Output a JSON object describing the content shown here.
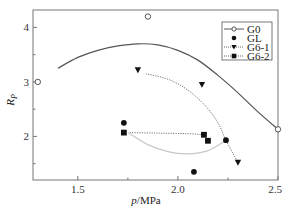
{
  "chart_data": {
    "type": "scatter",
    "title": "",
    "xlabel": "p/MPa",
    "ylabel": "R_P",
    "xlim": [
      1.276,
      2.5
    ],
    "ylim": [
      1.2,
      4.32
    ],
    "xticks": [
      1.5,
      2.0,
      2.5
    ],
    "xtick_labels": [
      "1.5",
      "2.0",
      "2.5"
    ],
    "xminor_ticks": [
      1.75,
      2.25
    ],
    "yticks": [
      2,
      3,
      4
    ],
    "ytick_labels": [
      "2",
      "3",
      "4"
    ],
    "yminor_ticks": [
      1.5,
      2.5,
      3.5
    ],
    "grid": false,
    "legend_position": "upper right",
    "series": [
      {
        "name": "G0",
        "marker": "open-circle",
        "line": "solid",
        "color": "#444444",
        "points": [
          [
            1.3,
            3.0
          ],
          [
            1.85,
            4.2
          ],
          [
            2.5,
            2.13
          ]
        ],
        "fit_curve": [
          [
            1.4,
            3.25
          ],
          [
            1.5,
            3.45
          ],
          [
            1.6,
            3.58
          ],
          [
            1.7,
            3.66
          ],
          [
            1.8,
            3.7
          ],
          [
            1.9,
            3.68
          ],
          [
            2.0,
            3.58
          ],
          [
            2.1,
            3.4
          ],
          [
            2.2,
            3.12
          ],
          [
            2.3,
            2.8
          ],
          [
            2.4,
            2.45
          ],
          [
            2.5,
            2.13
          ]
        ]
      },
      {
        "name": "GL",
        "marker": "filled-circle",
        "line": "solid-light",
        "color": "#bbbbbb",
        "points": [
          [
            1.73,
            2.25
          ],
          [
            2.08,
            1.35
          ],
          [
            2.24,
            1.93
          ]
        ],
        "fit_curve": [
          [
            1.75,
            2.07
          ],
          [
            1.85,
            1.85
          ],
          [
            1.95,
            1.72
          ],
          [
            2.05,
            1.68
          ],
          [
            2.15,
            1.74
          ],
          [
            2.24,
            1.93
          ]
        ]
      },
      {
        "name": "G6-1",
        "marker": "filled-triangle-down",
        "line": "dotted",
        "color": "#555555",
        "points": [
          [
            1.8,
            3.22
          ],
          [
            2.12,
            2.95
          ],
          [
            2.3,
            1.52
          ]
        ],
        "fit_curve": [
          [
            1.84,
            3.15
          ],
          [
            1.95,
            3.05
          ],
          [
            2.05,
            2.85
          ],
          [
            2.14,
            2.55
          ],
          [
            2.2,
            2.25
          ],
          [
            2.24,
            1.93
          ],
          [
            2.3,
            1.52
          ]
        ]
      },
      {
        "name": "G6-2",
        "marker": "filled-square",
        "line": "dotted",
        "color": "#555555",
        "points": [
          [
            1.73,
            2.07
          ],
          [
            2.13,
            2.03
          ],
          [
            2.15,
            1.92
          ]
        ],
        "fit_curve": [
          [
            1.76,
            2.07
          ],
          [
            1.9,
            2.06
          ],
          [
            2.05,
            2.05
          ],
          [
            2.13,
            2.03
          ]
        ]
      }
    ]
  },
  "axes": {
    "x_title_italic": "p",
    "x_title_unit": "/MPa",
    "y_title_main": "R",
    "y_title_sub": "P"
  },
  "legend": {
    "items": [
      {
        "label": "G0"
      },
      {
        "label": "GL"
      },
      {
        "label": "G6-1"
      },
      {
        "label": "G6-2"
      }
    ]
  }
}
